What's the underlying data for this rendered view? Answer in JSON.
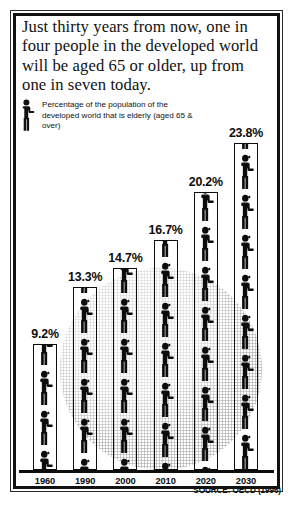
{
  "headline": "Just thirty years from now, one in four people in the developed world will be aged 65 or older, up from one in seven today.",
  "legend": {
    "icon": "person-figure-icon",
    "text": "Percentage of the population of the developed world that is elderly (aged 65 & over)"
  },
  "source": "SOURCE: OECD (1996)",
  "colors": {
    "ink": "#0d0d0d",
    "frame": "#111111",
    "watermark": "#737373",
    "background": "#ffffff"
  },
  "chart_data": {
    "type": "bar",
    "title": "Just thirty years from now, one in four people in the developed world will be aged 65 or older, up from one in seven today.",
    "xlabel": "",
    "ylabel": "Percentage of the population of the developed world that is elderly (aged 65 & over)",
    "categories": [
      "1960",
      "1990",
      "2000",
      "2010",
      "2020",
      "2030"
    ],
    "values": [
      9.2,
      13.3,
      14.7,
      16.7,
      20.2,
      23.8
    ],
    "value_labels": [
      "9.2%",
      "13.3%",
      "14.7%",
      "16.7%",
      "20.2%",
      "23.8%"
    ],
    "ylim": [
      0,
      23.8
    ],
    "grid": false,
    "legend_position": "top-left",
    "units": "percent",
    "series": [
      {
        "name": "Percentage aged 65 & over",
        "values": [
          9.2,
          13.3,
          14.7,
          16.7,
          20.2,
          23.8
        ]
      }
    ],
    "annotations": [
      "SOURCE: OECD (1996)"
    ],
    "pictogram": "stacked human figures inside outlined column"
  }
}
